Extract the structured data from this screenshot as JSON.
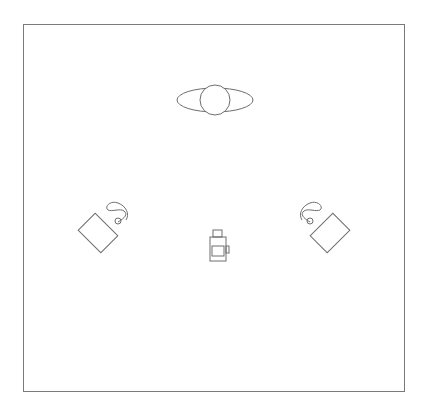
{
  "diagram": {
    "type": "lighting-setup-floor-plan",
    "stroke_color": "#6e6e6e",
    "elements": [
      {
        "id": "subject",
        "label": "subject-top-view",
        "shape": "ellipse-with-circle"
      },
      {
        "id": "light-left",
        "label": "softbox-left",
        "shape": "rotated-rectangle-with-cable"
      },
      {
        "id": "light-right",
        "label": "softbox-right",
        "shape": "rotated-rectangle-with-cable"
      },
      {
        "id": "camera",
        "label": "camera-top-view",
        "shape": "camera-outline"
      }
    ]
  }
}
